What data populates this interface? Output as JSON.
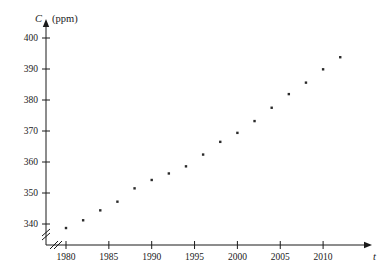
{
  "chart_data": {
    "type": "scatter",
    "title": "",
    "xlabel": "t",
    "ylabel": "C",
    "yunit": "(ppm)",
    "x": [
      1980,
      1982,
      1984,
      1986,
      1988,
      1990,
      1992,
      1994,
      1996,
      1998,
      2000,
      2002,
      2004,
      2006,
      2008,
      2010,
      2012
    ],
    "values": [
      338.7,
      341.2,
      344.4,
      347.2,
      351.5,
      354.2,
      356.3,
      358.6,
      362.4,
      366.5,
      369.4,
      373.2,
      377.5,
      381.9,
      385.6,
      389.9,
      393.8
    ],
    "xlim": [
      1978.4,
      2013.5
    ],
    "ylim": [
      335.0,
      402.0
    ],
    "xticks": [
      1980,
      1985,
      1990,
      1995,
      2000,
      2005,
      2010
    ],
    "xtick_labels": [
      "1980",
      "1985",
      "1990",
      "1995",
      "2000",
      "2005",
      "2010"
    ],
    "yticks": [
      340,
      350,
      360,
      370,
      380,
      390,
      400
    ],
    "ytick_labels": [
      "340",
      "350",
      "360",
      "370",
      "380",
      "390",
      "400"
    ],
    "grid": false,
    "legend": null,
    "axis_break_x": true,
    "axis_break_y": true,
    "marker": "dot",
    "marker_color": "#2a2a2a",
    "axis_color": "#1a1a1a",
    "background": "#ffffff"
  }
}
